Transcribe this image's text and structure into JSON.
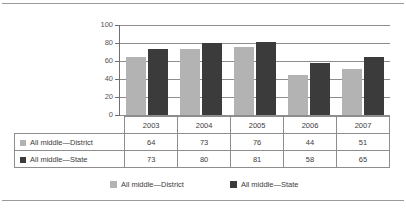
{
  "chart_data": {
    "type": "bar",
    "title": "",
    "xlabel": "",
    "ylabel": "",
    "categories": [
      "2003",
      "2004",
      "2005",
      "2006",
      "2007"
    ],
    "series": [
      {
        "name": "All middle—District",
        "color": "#b3b3b3",
        "values": [
          64,
          73,
          76,
          44,
          51
        ]
      },
      {
        "name": "All middle—State",
        "color": "#3b3b3b",
        "values": [
          73,
          80,
          81,
          58,
          65
        ]
      }
    ],
    "ylim": [
      0,
      100
    ],
    "yticks": [
      0,
      20,
      40,
      60,
      80,
      100
    ],
    "ytick_labels": [
      "0",
      "20",
      "40",
      "60",
      "80",
      "100"
    ],
    "grid": true,
    "legend_position": "bottom",
    "data_table_visible": true
  },
  "table": {
    "header_row": [
      "",
      "2003",
      "2004",
      "2005",
      "2006",
      "2007"
    ],
    "rows": [
      {
        "label": "All middle—District",
        "swatch": "district",
        "values": [
          "64",
          "73",
          "76",
          "44",
          "51"
        ]
      },
      {
        "label": "All middle—State",
        "swatch": "state",
        "values": [
          "73",
          "80",
          "81",
          "58",
          "65"
        ]
      }
    ]
  },
  "legend": {
    "entries": [
      {
        "label": "All middle—District",
        "swatch": "district"
      },
      {
        "label": "All middle—State",
        "swatch": "state"
      }
    ]
  }
}
